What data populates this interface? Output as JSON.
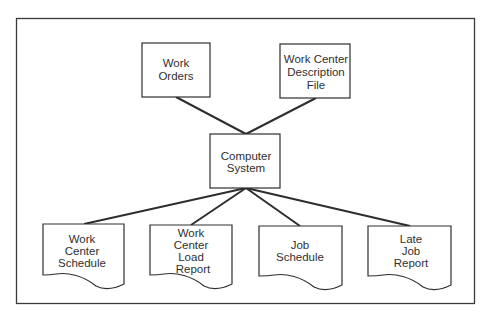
{
  "diagram": {
    "type": "data-flow",
    "frame": {
      "x": 16,
      "y": 18,
      "w": 459,
      "h": 286
    },
    "colors": {
      "stroke": "#2e2e2e",
      "text": "#2f2f2f",
      "background": "#ffffff"
    },
    "inputs": [
      {
        "id": "work-orders",
        "lines": [
          "Work",
          "Orders"
        ]
      },
      {
        "id": "work-center-description-file",
        "lines": [
          "Work Center",
          "Description",
          "File"
        ]
      }
    ],
    "processor": {
      "id": "computer-system",
      "lines": [
        "Computer",
        "System"
      ]
    },
    "outputs": [
      {
        "id": "work-center-schedule",
        "lines": [
          "Work",
          "Center",
          "Schedule"
        ]
      },
      {
        "id": "work-center-load-report",
        "lines": [
          "Work",
          "Center",
          "Load",
          "Report"
        ]
      },
      {
        "id": "job-schedule",
        "lines": [
          "Job",
          "Schedule"
        ]
      },
      {
        "id": "late-job-report",
        "lines": [
          "Late",
          "Job",
          "Report"
        ]
      }
    ],
    "connections": [
      {
        "from": "work-orders",
        "to": "computer-system"
      },
      {
        "from": "work-center-description-file",
        "to": "computer-system"
      },
      {
        "from": "computer-system",
        "to": "work-center-schedule"
      },
      {
        "from": "computer-system",
        "to": "work-center-load-report"
      },
      {
        "from": "computer-system",
        "to": "job-schedule"
      },
      {
        "from": "computer-system",
        "to": "late-job-report"
      }
    ]
  }
}
